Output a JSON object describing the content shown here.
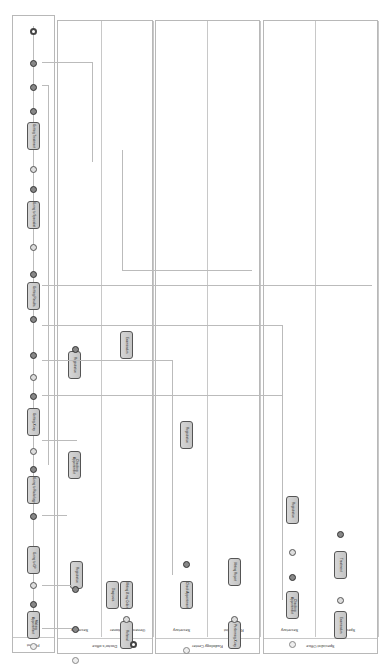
{
  "diagram": {
    "type": "BPMN collaboration (rotated)",
    "pools": [
      {
        "name": "Patient",
        "lanes": []
      },
      {
        "name": "Doctor's office",
        "lanes": [
          "Secretary",
          "General practitioner"
        ]
      },
      {
        "name": "Radiology Center",
        "lanes": [
          "Secretary",
          "Radiologist"
        ]
      },
      {
        "name": "Specialist Office",
        "lanes": [
          "Secretary",
          "Specialist"
        ]
      }
    ],
    "patient_tasks": [
      "Making Appointment",
      "Going to GP",
      "Going to Radiology",
      "Getting X-ray",
      "Getting Results",
      "Going to Specialist",
      "Getting Treatment"
    ],
    "gp_tasks": [
      "Registration",
      "Checking Appointment",
      "Registration"
    ],
    "gp_doctor_tasks": [
      "Examination",
      "Diagnosis",
      "Writing X-ray Order",
      "Referral",
      "Diagnosis"
    ],
    "radiology_tasks": [
      "Check Appointment",
      "Registration"
    ],
    "radiologist_tasks": [
      "Performing X-ray",
      "Writing Report"
    ],
    "specialist_secretary_tasks": [
      "Checking Appointment",
      "Registration"
    ],
    "specialist_tasks": [
      "Examination",
      "Treatment"
    ],
    "end_label": "End"
  }
}
